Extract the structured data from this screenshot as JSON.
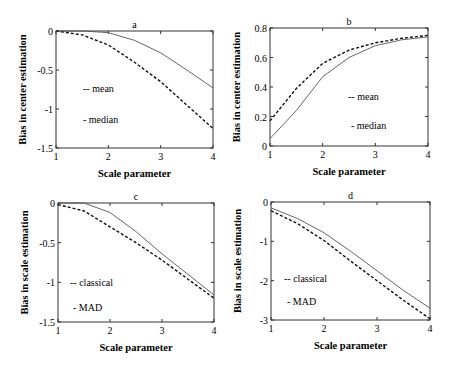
{
  "chart_data": [
    {
      "type": "line",
      "title": "a",
      "xlabel": "Scale parameter",
      "ylabel": "Bias in center estimation",
      "xlim": [
        1,
        4
      ],
      "ylim": [
        -1.5,
        0
      ],
      "xticks": [
        "1",
        "2",
        "3",
        "4"
      ],
      "yticks": [
        "0",
        "-0.5",
        "-1",
        "-1.5"
      ],
      "grid": false,
      "legend": [
        "-- mean",
        "- median"
      ],
      "x": [
        1,
        1.5,
        2,
        2.5,
        3,
        3.5,
        4
      ],
      "series": [
        {
          "name": "mean",
          "style": "dashed",
          "values": [
            0,
            -0.05,
            -0.18,
            -0.4,
            -0.65,
            -0.95,
            -1.25
          ]
        },
        {
          "name": "median",
          "style": "solid",
          "values": [
            0,
            0,
            -0.02,
            -0.12,
            -0.28,
            -0.5,
            -0.73
          ]
        }
      ]
    },
    {
      "type": "line",
      "title": "b",
      "xlabel": "Scale parameter",
      "ylabel": "Bias in center estimation",
      "xlim": [
        1,
        4
      ],
      "ylim": [
        0,
        0.8
      ],
      "xticks": [
        "1",
        "2",
        "3",
        "4"
      ],
      "yticks": [
        "0",
        "0.2",
        "0.4",
        "0.6",
        "0.8"
      ],
      "grid": false,
      "legend": [
        "-- mean",
        "- median"
      ],
      "x": [
        1,
        1.5,
        2,
        2.5,
        3,
        3.5,
        4
      ],
      "series": [
        {
          "name": "mean",
          "style": "dashed",
          "values": [
            0.17,
            0.39,
            0.56,
            0.65,
            0.7,
            0.73,
            0.75
          ]
        },
        {
          "name": "median",
          "style": "solid",
          "values": [
            0.05,
            0.24,
            0.47,
            0.6,
            0.68,
            0.72,
            0.74
          ]
        }
      ]
    },
    {
      "type": "line",
      "title": "c",
      "xlabel": "Scale parameter",
      "ylabel": "Bias in scale estimation",
      "xlim": [
        1,
        4
      ],
      "ylim": [
        -1.5,
        0
      ],
      "xticks": [
        "1",
        "2",
        "3",
        "4"
      ],
      "yticks": [
        "0",
        "-0.5",
        "-1",
        "-1.5"
      ],
      "grid": false,
      "legend": [
        "-- classical",
        "- MAD"
      ],
      "x": [
        1,
        1.5,
        2,
        2.5,
        3,
        3.5,
        4
      ],
      "series": [
        {
          "name": "classical",
          "style": "dashed",
          "values": [
            -0.02,
            -0.1,
            -0.3,
            -0.5,
            -0.72,
            -0.96,
            -1.2
          ]
        },
        {
          "name": "MAD",
          "style": "solid",
          "values": [
            0,
            0,
            -0.12,
            -0.36,
            -0.64,
            -0.9,
            -1.16
          ]
        }
      ]
    },
    {
      "type": "line",
      "title": "d",
      "xlabel": "Scale parameter",
      "ylabel": "Bias in scale estimation",
      "xlim": [
        1,
        4
      ],
      "ylim": [
        -3,
        0
      ],
      "xticks": [
        "1",
        "2",
        "3",
        "4"
      ],
      "yticks": [
        "0",
        "-1",
        "-2",
        "-3"
      ],
      "grid": false,
      "legend": [
        "-- classical",
        "- MAD"
      ],
      "x": [
        1,
        1.5,
        2,
        2.5,
        3,
        3.5,
        4
      ],
      "series": [
        {
          "name": "classical",
          "style": "dashed",
          "values": [
            -0.22,
            -0.55,
            -0.98,
            -1.5,
            -2.0,
            -2.5,
            -2.97
          ]
        },
        {
          "name": "MAD",
          "style": "solid",
          "values": [
            -0.15,
            -0.42,
            -0.78,
            -1.25,
            -1.75,
            -2.25,
            -2.7
          ]
        }
      ]
    }
  ]
}
